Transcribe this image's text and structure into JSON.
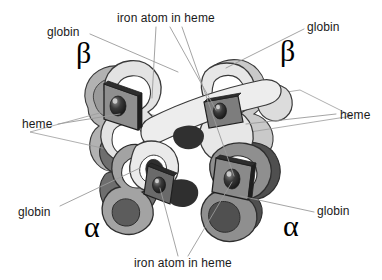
{
  "figure": {
    "background_color": "#ffffff",
    "width": 382,
    "height": 280
  },
  "labels": {
    "globin_top_left": "globin",
    "globin_top_right": "globin",
    "globin_bottom_left": "globin",
    "globin_bottom_right": "globin",
    "iron_atom_top": "iron atom in heme",
    "iron_atom_bottom": "iron atom in heme",
    "heme_left": "heme",
    "heme_right": "heme"
  },
  "subunits": {
    "beta_left": "β",
    "beta_right": "β",
    "alpha_left": "α",
    "alpha_right": "α"
  },
  "colors": {
    "leader_line": "#9a9a9a",
    "outline": "#3a3a3a",
    "globin_light": "#e3e3e3",
    "globin_light_shade": "#c9c9c9",
    "globin_mid": "#b2b2b2",
    "globin_mid_shade": "#9a9a9a",
    "globin_dark": "#8a8a8a",
    "globin_dark_shade": "#6e6e6e",
    "globin_darkest": "#4f4f4f",
    "heme_plate": "#2e2e2e",
    "heme_plate_face": "#8f8f8f",
    "iron_atom": "#2a2a2a",
    "text": "#1a1a1a"
  }
}
